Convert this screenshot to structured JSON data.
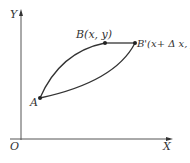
{
  "diagram": {
    "axes": {
      "origin_label": "O",
      "x_label": "X",
      "y_label": "Y"
    },
    "points": [
      {
        "id": "A",
        "label": "A"
      },
      {
        "id": "B",
        "label": "B(x, y)"
      },
      {
        "id": "B_prime",
        "label": "B'(x+ Δ x, y)"
      }
    ],
    "curves": [
      {
        "from": "A",
        "to": "B",
        "shape": "upper arc"
      },
      {
        "from": "B",
        "to": "B_prime",
        "shape": "straight segment"
      },
      {
        "from": "A",
        "to": "B_prime",
        "shape": "lower arc"
      }
    ],
    "colors": {
      "line": "#333333",
      "background": "#ffffff"
    }
  }
}
